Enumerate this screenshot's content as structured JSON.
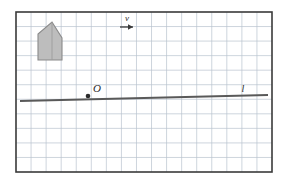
{
  "figure": {
    "width": 285,
    "height": 180,
    "background_color": "#ffffff"
  },
  "frame": {
    "name": "plot-border",
    "x": 16,
    "y": 12,
    "width": 256,
    "height": 160,
    "stroke_color": "#3a3a3a",
    "stroke_width": 1.6
  },
  "grid": {
    "color": "#b9c3cf",
    "stroke_width": 0.7,
    "cell_size": 15,
    "columns": 17,
    "rows": 11,
    "visible": true
  },
  "house": {
    "name": "house-polygon",
    "points": "38,60 38,34 52,22 62,38 62,60",
    "fill_color": "#bdbdbd",
    "stroke_color": "#8a8a8a",
    "stroke_width": 1.1,
    "inner_edge": "52,22 52,60"
  },
  "vector_v": {
    "label": "v",
    "label_x": 127,
    "label_y": 21,
    "shaft_x1": 120,
    "shaft_x2": 133,
    "shaft_y": 27,
    "color": "#3a3a3a",
    "stroke_width": 1.3,
    "arrowhead": "133,27 128,24.3 128,29.7"
  },
  "origin": {
    "label": "O",
    "label_x": 97,
    "label_y": 92,
    "dot_x": 88,
    "dot_y": 96,
    "dot_radius": 2.3,
    "color": "#2b2b2b"
  },
  "line_l": {
    "label": "l",
    "label_x": 243,
    "label_y": 92,
    "x1": 20,
    "y1": 101,
    "x2": 268,
    "y2": 95,
    "color": "#595959",
    "stroke_width": 1.8
  }
}
